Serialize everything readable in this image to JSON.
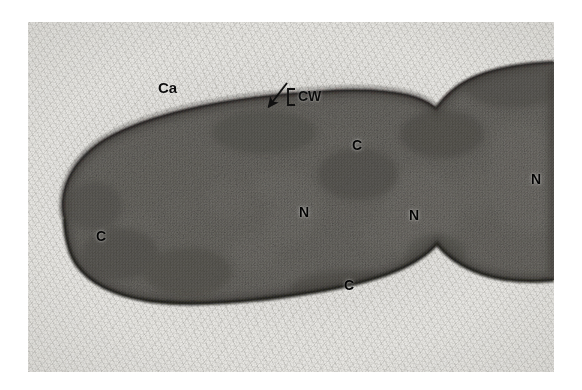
{
  "figure": {
    "kind": "transmission-electron-micrograph",
    "width_px": 582,
    "height_px": 390,
    "background_color": "#ffffff",
    "plate": {
      "left_px": 28,
      "top_px": 22,
      "width_px": 526,
      "height_px": 350,
      "tone": "grayscale",
      "base_color": "#e6e5e1",
      "cell_color": "#5d5b57",
      "membrane_color": "#232220",
      "nucleoid_color": "#c9c7c2"
    }
  },
  "annotations": {
    "labels": [
      {
        "id": "ca",
        "text": "Ca",
        "meaning": "capsule",
        "x": 158,
        "y": 80,
        "contrast": "light"
      },
      {
        "id": "cw",
        "text": "CW",
        "meaning": "cell wall",
        "x": 298,
        "y": 96,
        "contrast": "light"
      },
      {
        "id": "c1",
        "text": "C",
        "meaning": "cytoplasm",
        "x": 352,
        "y": 138,
        "contrast": "dark"
      },
      {
        "id": "c2",
        "text": "C",
        "meaning": "cytoplasm",
        "x": 96,
        "y": 229,
        "contrast": "dark"
      },
      {
        "id": "n1",
        "text": "N",
        "meaning": "nucleoid",
        "x": 299,
        "y": 205,
        "contrast": "dark"
      },
      {
        "id": "n2",
        "text": "N",
        "meaning": "nucleoid",
        "x": 409,
        "y": 208,
        "contrast": "dark"
      },
      {
        "id": "n3",
        "text": "N",
        "meaning": "nucleoid",
        "x": 531,
        "y": 172,
        "contrast": "dark"
      },
      {
        "id": "c3",
        "text": "C",
        "meaning": "cytoplasm",
        "x": 344,
        "y": 278,
        "contrast": "dark"
      }
    ],
    "arrow": {
      "id": "cell-wall-arrow",
      "meaning": "points to cell wall / outer envelope",
      "tail_x": 287,
      "tail_y": 83,
      "head_x": 266,
      "head_y": 110
    },
    "bracket": {
      "id": "cell-wall-bracket",
      "meaning": "brackets the cell wall layer next to the CW label",
      "x": 288,
      "y": 96,
      "height": 12,
      "arm": 5
    }
  },
  "legend_key": [
    {
      "symbol": "Ca",
      "description": "Capsule"
    },
    {
      "symbol": "CW",
      "description": "Cell wall"
    },
    {
      "symbol": "C",
      "description": "Cytoplasm"
    },
    {
      "symbol": "N",
      "description": "Nucleoid"
    }
  ]
}
